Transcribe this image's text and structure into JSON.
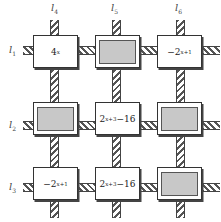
{
  "diagram": {
    "column_labels": [
      {
        "base": "l",
        "sub": "4"
      },
      {
        "base": "l",
        "sub": "5"
      },
      {
        "base": "l",
        "sub": "6"
      }
    ],
    "row_labels": [
      {
        "base": "l",
        "sub": "1"
      },
      {
        "base": "l",
        "sub": "2"
      },
      {
        "base": "l",
        "sub": "3"
      }
    ],
    "cells": [
      [
        {
          "shaded": false,
          "base": "4",
          "exp": "x",
          "suffix": "",
          "prefix": ""
        },
        {
          "shaded": true
        },
        {
          "shaded": false,
          "prefix": "−",
          "base": "2",
          "exp": "x+1",
          "suffix": ""
        }
      ],
      [
        {
          "shaded": true
        },
        {
          "shaded": false,
          "prefix": "",
          "base": "2",
          "exp": "x+3",
          "suffix": "−16"
        },
        {
          "shaded": true
        }
      ],
      [
        {
          "shaded": false,
          "prefix": "−",
          "base": "2",
          "exp": "x+1",
          "suffix": ""
        },
        {
          "shaded": false,
          "prefix": "",
          "base": "2",
          "exp": "x+3",
          "suffix": "−16"
        },
        {
          "shaded": true
        }
      ]
    ],
    "colors": {
      "shade": "#c8c8c8",
      "border": "#333333",
      "rope": "#555555"
    }
  }
}
